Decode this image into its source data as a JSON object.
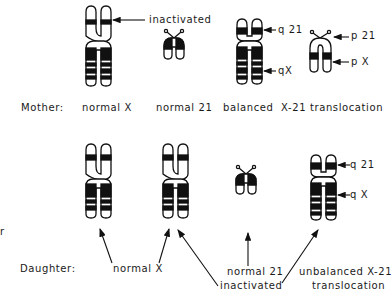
{
  "mother": {
    "row_label": "Mother:",
    "labels": {
      "normal_x": "normal X",
      "normal_21": "normal 21",
      "balanced": "balanced  X-21 translocation"
    },
    "annotations": {
      "inactivated": "inactivated",
      "q21": "q 21",
      "qX": "qX",
      "p21": "p 21",
      "pX": "p X"
    }
  },
  "daughter": {
    "row_label": "Daughter:",
    "labels": {
      "normal_x": "normal X",
      "normal_21": "normal 21",
      "inactivated": "inactivated",
      "unbalanced_line1": "unbalanced X-21",
      "unbalanced_line2": "translocation"
    },
    "annotations": {
      "q21": "q 21",
      "qX": "q X"
    }
  },
  "edge_fragment": "r",
  "colors": {
    "ink": "#111111",
    "background": "#ffffff"
  }
}
